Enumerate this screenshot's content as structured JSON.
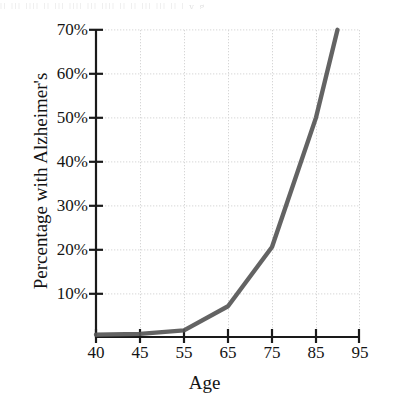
{
  "figure": {
    "artifact_text": "|| ||| |||| || ||| |||| ||| |||| || ||  ||| ||| ||   |    y    g",
    "accent_color": "#575757",
    "grid_color": "#d8d8d8",
    "axis_color": "#1a1a1a",
    "background": "#ffffff"
  },
  "chart_data": {
    "type": "line",
    "title": "",
    "xlabel": "Age",
    "ylabel": "Percentage with Alzheimer's",
    "x": [
      40,
      45,
      55,
      65,
      75,
      85,
      90
    ],
    "values": [
      0.5,
      0.7,
      1.5,
      7,
      20.5,
      50,
      70
    ],
    "series": [
      {
        "name": "Percentage with Alzheimer's",
        "color": "#575757",
        "values": [
          0.5,
          0.7,
          1.5,
          7,
          20.5,
          50,
          70
        ]
      }
    ],
    "xtick_values": [
      40,
      45,
      55,
      65,
      75,
      85,
      95
    ],
    "xtick_labels": [
      "40",
      "45",
      "55",
      "65",
      "75",
      "85",
      "95"
    ],
    "ytick_values": [
      10,
      20,
      30,
      40,
      50,
      60,
      70
    ],
    "ytick_labels": [
      "10%",
      "20%",
      "30%",
      "40%",
      "50%",
      "60%",
      "70%"
    ],
    "xlim": [
      40,
      95
    ],
    "ylim": [
      0,
      70
    ],
    "grid": true,
    "grid_style": "dotted",
    "legend": false,
    "note": "x-axis ticks are evenly spaced although the first interval spans 5 years and the rest span 10 years"
  }
}
